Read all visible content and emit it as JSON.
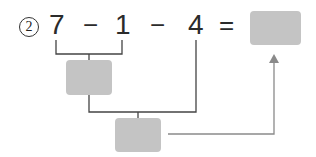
{
  "problem": {
    "number_label": "2",
    "expression": {
      "tokens": [
        "7",
        "−",
        "1",
        "−",
        "4",
        "="
      ]
    }
  },
  "boxes": {
    "result": "",
    "step1": "",
    "step2": ""
  },
  "colors": {
    "box_fill": "#c4c4c4",
    "line": "#444444",
    "arrow": "#8a8a8a",
    "text": "#2b2b2b"
  }
}
